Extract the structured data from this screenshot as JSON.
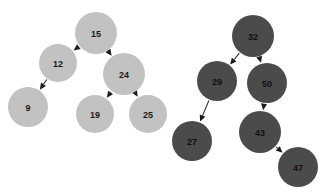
{
  "diagram": {
    "background_color": "#ffffff",
    "trees": [
      {
        "id": "left-tree",
        "name": "light-tree",
        "node_fill": "#c2c2c2",
        "label_color": "#1a1a1a",
        "root": "15",
        "nodes": [
          {
            "id": "n15",
            "label": "15",
            "cx": 96,
            "cy": 33,
            "r": 21
          },
          {
            "id": "n12",
            "label": "12",
            "cx": 58,
            "cy": 63,
            "r": 19
          },
          {
            "id": "n9",
            "label": "9",
            "cx": 28,
            "cy": 107,
            "r": 20
          },
          {
            "id": "n24",
            "label": "24",
            "cx": 124,
            "cy": 74,
            "r": 21
          },
          {
            "id": "n19",
            "label": "19",
            "cx": 95,
            "cy": 114,
            "r": 19
          },
          {
            "id": "n25",
            "label": "25",
            "cx": 148,
            "cy": 114,
            "r": 19
          }
        ],
        "edges": [
          {
            "from": "n15",
            "to": "n12"
          },
          {
            "from": "n15",
            "to": "n24"
          },
          {
            "from": "n12",
            "to": "n9"
          },
          {
            "from": "n24",
            "to": "n19"
          },
          {
            "from": "n24",
            "to": "n25"
          }
        ]
      },
      {
        "id": "right-tree",
        "name": "dark-tree",
        "node_fill": "#4b4b4b",
        "label_color": "#111111",
        "root": "32",
        "nodes": [
          {
            "id": "n32",
            "label": "32",
            "cx": 253,
            "cy": 36,
            "r": 21
          },
          {
            "id": "n29",
            "label": "29",
            "cx": 217,
            "cy": 81,
            "r": 20
          },
          {
            "id": "n27",
            "label": "27",
            "cx": 192,
            "cy": 141,
            "r": 20
          },
          {
            "id": "n50",
            "label": "50",
            "cx": 267,
            "cy": 83,
            "r": 20
          },
          {
            "id": "n43",
            "label": "43",
            "cx": 260,
            "cy": 132,
            "r": 21
          },
          {
            "id": "n47",
            "label": "47",
            "cx": 298,
            "cy": 167,
            "r": 20
          }
        ],
        "edges": [
          {
            "from": "n32",
            "to": "n29"
          },
          {
            "from": "n32",
            "to": "n50"
          },
          {
            "from": "n29",
            "to": "n27"
          },
          {
            "from": "n50",
            "to": "n43"
          },
          {
            "from": "n43",
            "to": "n47"
          }
        ]
      }
    ]
  }
}
